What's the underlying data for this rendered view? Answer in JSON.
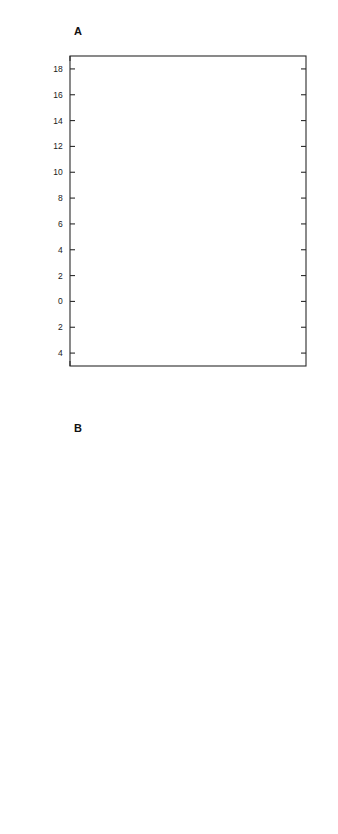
{
  "figure": {
    "panels": [
      {
        "letter": "A",
        "ylabel": "Change in Per Cent Errors",
        "ylabel_top": "Increase",
        "ylabel_bottom": "Decrease",
        "xlabel": "Irrelevant  Stimuli",
        "ytick_labels": [
          "18",
          "16",
          "14",
          "12",
          "10",
          "8",
          "6",
          "4",
          "2",
          "0",
          "2",
          "4"
        ],
        "xtick_labels": [
          "0",
          "1",
          "2",
          "3",
          "4",
          "5",
          "6",
          "7",
          "8",
          "9"
        ],
        "series_labels": [
          "SC",
          "FEF",
          "P",
          "C"
        ]
      },
      {
        "letter": "B",
        "ylabel": "Change in Latency (msec)",
        "ylabel_top": "Increase",
        "ylabel_bottom": "Decrease",
        "xlabel": "Irrelevant  Stimuli",
        "ytick_labels": [
          "400",
          "300",
          "200",
          "100",
          "0",
          "100",
          "200"
        ],
        "xtick_labels": [
          "0",
          "1",
          "2",
          "3",
          "4",
          "5",
          "6",
          "7",
          "8",
          "9"
        ],
        "series_labels": [
          "SC",
          "P",
          "FEF",
          "C"
        ]
      }
    ]
  },
  "chart_data": [
    {
      "type": "line",
      "title": "A",
      "xlabel": "Irrelevant Stimuli",
      "ylabel": "Change in Per Cent Errors",
      "ylabel_top": "Increase",
      "ylabel_bottom": "Decrease",
      "x": [
        0,
        1,
        3,
        5,
        7,
        9
      ],
      "xlim": [
        0,
        9.6
      ],
      "ylim": [
        -5,
        19
      ],
      "yticks": [
        18,
        16,
        14,
        12,
        10,
        8,
        6,
        4,
        2,
        0,
        -2,
        -4
      ],
      "ytick_labels": [
        "18",
        "16",
        "14",
        "12",
        "10",
        "8",
        "6",
        "4",
        "2",
        "0",
        "2",
        "4"
      ],
      "xticks": [
        0,
        1,
        2,
        3,
        4,
        5,
        6,
        7,
        8,
        9
      ],
      "grid": false,
      "legend_position": "right-inline",
      "zero_reference_line": 0,
      "series": [
        {
          "name": "SC",
          "marker": "open-circle",
          "linestyle": "solid",
          "values": [
            0.0,
            7.4,
            10.1,
            11.7,
            14.6,
            16.7
          ]
        },
        {
          "name": "FEF",
          "marker": "open-triangle",
          "linestyle": "solid",
          "values": [
            0.0,
            4.2,
            3.6,
            1.8,
            4.4,
            5.5
          ]
        },
        {
          "name": "P",
          "marker": "open-square",
          "linestyle": "solid",
          "values": [
            0.9,
            -0.4,
            -0.6,
            0.7,
            -0.3,
            1.5
          ]
        },
        {
          "name": "C",
          "marker": "filled-circle",
          "linestyle": "dashed",
          "values": [
            -0.4,
            -2.1,
            -1.2,
            -2.8,
            0.6,
            -2.4
          ]
        }
      ]
    },
    {
      "type": "line",
      "title": "B",
      "xlabel": "Irrelevant Stimuli",
      "ylabel": "Change in Latency (msec)",
      "ylabel_top": "Increase",
      "ylabel_bottom": "Decrease",
      "x": [
        0,
        1,
        3,
        5,
        7,
        9
      ],
      "xlim": [
        0,
        9.6
      ],
      "ylim": [
        -200,
        450
      ],
      "yticks": [
        400,
        300,
        200,
        100,
        0,
        -100,
        -200
      ],
      "ytick_labels": [
        "400",
        "300",
        "200",
        "100",
        "0",
        "100",
        "200"
      ],
      "xticks": [
        0,
        1,
        2,
        3,
        4,
        5,
        6,
        7,
        8,
        9
      ],
      "grid": false,
      "legend_position": "right-inline",
      "zero_reference_line": 0,
      "series": [
        {
          "name": "SC",
          "marker": "open-circle",
          "linestyle": "solid",
          "values": [
            312,
            327,
            322,
            393,
            294,
            254
          ]
        },
        {
          "name": "P",
          "marker": "open-square",
          "linestyle": "solid",
          "values": [
            -8,
            14,
            68,
            105,
            60,
            72
          ]
        },
        {
          "name": "FEF",
          "marker": "open-triangle",
          "linestyle": "solid",
          "values": [
            117,
            75,
            67,
            96,
            62,
            44
          ]
        },
        {
          "name": "C",
          "marker": "filled-circle",
          "linestyle": "dashed",
          "values": [
            -14,
            -96,
            -65,
            -92,
            -88,
            -132
          ]
        }
      ]
    }
  ]
}
